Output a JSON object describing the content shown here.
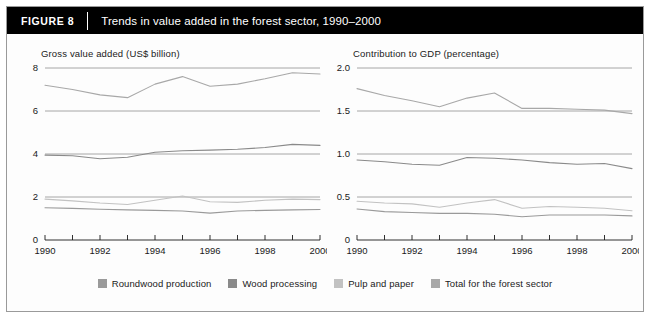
{
  "figure": {
    "tag": "FIGURE  8",
    "title": "Trends in value added in the forest sector, 1990–2000"
  },
  "legend": {
    "items": [
      {
        "label": "Roundwood production",
        "color": "#9a9a9a"
      },
      {
        "label": "Wood processing",
        "color": "#8a8a8a"
      },
      {
        "label": "Pulp and paper",
        "color": "#c2c2c2"
      },
      {
        "label": "Total for the forest sector",
        "color": "#a8a8a8"
      }
    ]
  },
  "colors": {
    "gridline": "#8f8f8f",
    "axis": "#1a1a1a",
    "background": "#fdfdfd",
    "titlebar": "#000000",
    "frame_border": "#9a9a9a"
  },
  "chart_data": [
    {
      "type": "line",
      "title": "Gross value added (US$ billion)",
      "xlabel": "",
      "ylabel": "Gross value added (US$ billion)",
      "x": [
        1990,
        1991,
        1992,
        1993,
        1994,
        1995,
        1996,
        1997,
        1998,
        1999,
        2000
      ],
      "xlim": [
        1990,
        2000
      ],
      "ylim": [
        0,
        8
      ],
      "yticks": [
        0,
        2,
        4,
        6,
        8
      ],
      "ytick_labels": [
        "0",
        "2",
        "4",
        "6",
        "8"
      ],
      "xticks": [
        1990,
        1991,
        1992,
        1993,
        1994,
        1995,
        1996,
        1997,
        1998,
        1999,
        2000
      ],
      "xtick_labels": [
        "1990",
        "",
        "1992",
        "",
        "1994",
        "",
        "1996",
        "",
        "1998",
        "",
        "2000"
      ],
      "grid": true,
      "legend_position": "bottom",
      "series": [
        {
          "name": "Total for the forest sector",
          "color": "#a8a8a8",
          "values": [
            7.2,
            7.0,
            6.75,
            6.62,
            7.25,
            7.6,
            7.15,
            7.25,
            7.5,
            7.78,
            7.72
          ]
        },
        {
          "name": "Wood processing",
          "color": "#8a8a8a",
          "values": [
            3.95,
            3.92,
            3.78,
            3.85,
            4.08,
            4.15,
            4.18,
            4.22,
            4.3,
            4.45,
            4.4
          ]
        },
        {
          "name": "Pulp and paper",
          "color": "#c2c2c2",
          "values": [
            1.9,
            1.82,
            1.72,
            1.65,
            1.85,
            2.05,
            1.78,
            1.75,
            1.85,
            1.9,
            1.88
          ]
        },
        {
          "name": "Roundwood production",
          "color": "#9a9a9a",
          "values": [
            1.5,
            1.47,
            1.43,
            1.4,
            1.38,
            1.35,
            1.25,
            1.35,
            1.38,
            1.4,
            1.42
          ]
        }
      ]
    },
    {
      "type": "line",
      "title": "Contribution to GDP (percentage)",
      "xlabel": "",
      "ylabel": "Contribution to GDP (percentage)",
      "x": [
        1990,
        1991,
        1992,
        1993,
        1994,
        1995,
        1996,
        1997,
        1998,
        1999,
        2000
      ],
      "xlim": [
        1990,
        2000
      ],
      "ylim": [
        0,
        2.0
      ],
      "yticks": [
        0,
        0.5,
        1.0,
        1.5,
        2.0
      ],
      "ytick_labels": [
        "0",
        "0.5",
        "1.0",
        "1.5",
        "2.0"
      ],
      "xticks": [
        1990,
        1991,
        1992,
        1993,
        1994,
        1995,
        1996,
        1997,
        1998,
        1999,
        2000
      ],
      "xtick_labels": [
        "1990",
        "",
        "1992",
        "",
        "1994",
        "",
        "1996",
        "",
        "1998",
        "",
        "2000"
      ],
      "grid": true,
      "legend_position": "bottom",
      "series": [
        {
          "name": "Total for the forest sector",
          "color": "#a8a8a8",
          "values": [
            1.76,
            1.68,
            1.62,
            1.55,
            1.65,
            1.71,
            1.53,
            1.53,
            1.52,
            1.51,
            1.47
          ]
        },
        {
          "name": "Wood processing",
          "color": "#8a8a8a",
          "values": [
            0.93,
            0.91,
            0.88,
            0.87,
            0.96,
            0.95,
            0.93,
            0.9,
            0.88,
            0.89,
            0.83
          ]
        },
        {
          "name": "Pulp and paper",
          "color": "#c2c2c2",
          "values": [
            0.45,
            0.43,
            0.42,
            0.38,
            0.43,
            0.47,
            0.37,
            0.39,
            0.38,
            0.37,
            0.34
          ]
        },
        {
          "name": "Roundwood production",
          "color": "#9a9a9a",
          "values": [
            0.36,
            0.33,
            0.32,
            0.31,
            0.31,
            0.3,
            0.27,
            0.29,
            0.29,
            0.29,
            0.28
          ]
        }
      ]
    }
  ]
}
